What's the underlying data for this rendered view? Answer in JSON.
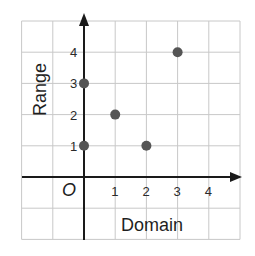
{
  "chart_data": {
    "type": "scatter",
    "title": "",
    "xlabel": "Domain",
    "ylabel": "Range",
    "origin_label": "O",
    "x_ticks": [
      "1",
      "2",
      "3",
      "4"
    ],
    "y_ticks": [
      "1",
      "2",
      "3",
      "4"
    ],
    "xlim": [
      -2,
      5
    ],
    "ylim": [
      -2,
      5
    ],
    "grid": true,
    "legend": null,
    "points": [
      {
        "x": 0,
        "y": 1
      },
      {
        "x": 0,
        "y": 3
      },
      {
        "x": 1,
        "y": 2
      },
      {
        "x": 2,
        "y": 1
      },
      {
        "x": 3,
        "y": 4
      }
    ],
    "colors": {
      "point": "#555555",
      "grid": "#c8c8c8",
      "axis": "#1a1a1a"
    }
  }
}
